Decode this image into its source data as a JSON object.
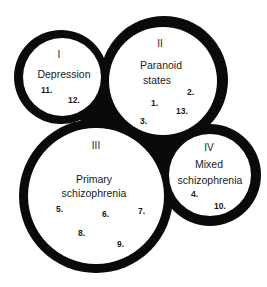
{
  "colors": {
    "ring": "#0a0a0a",
    "fill": "#ffffff",
    "text": "#1a1a1a"
  },
  "groups": [
    {
      "id": "I",
      "numeral": "I",
      "name_lines": [
        "Depression"
      ],
      "members": [
        "11.",
        "12."
      ]
    },
    {
      "id": "II",
      "numeral": "II",
      "name_lines": [
        "Paranoid",
        "states"
      ],
      "members": [
        "2.",
        "1.",
        "13.",
        "3."
      ]
    },
    {
      "id": "III",
      "numeral": "III",
      "name_lines": [
        "Primary",
        "schizophrenia"
      ],
      "members": [
        "5.",
        "6.",
        "7.",
        "8.",
        "9."
      ]
    },
    {
      "id": "IV",
      "numeral": "IV",
      "name_lines": [
        "Mixed",
        "schizophrenia"
      ],
      "members": [
        "4.",
        "10."
      ]
    }
  ]
}
